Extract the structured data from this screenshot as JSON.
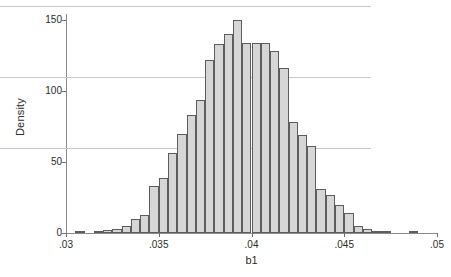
{
  "chart_data": {
    "type": "bar",
    "subtype": "histogram",
    "title": "",
    "xlabel": "b1",
    "ylabel": "Density",
    "xlim": [
      0.03,
      0.05
    ],
    "ylim": [
      0,
      150
    ],
    "xticks": [
      ".03",
      ".035",
      ".04",
      ".045",
      ".05"
    ],
    "xtick_values": [
      0.03,
      0.035,
      0.04,
      0.045,
      0.05
    ],
    "yticks": [
      "0",
      "50",
      "100",
      "150"
    ],
    "ytick_values": [
      0,
      50,
      100,
      150
    ],
    "grid": "horizontal",
    "legend": "none",
    "bar_fill_color": "#d6d6d6",
    "bar_edge_color": "#5d5d5d",
    "gridline_color": "#c9c9c9",
    "axis_color": "#8a8a8a",
    "bin_width": 0.0005,
    "bin_starts": [
      0.0305,
      0.031,
      0.0315,
      0.032,
      0.0325,
      0.033,
      0.0335,
      0.034,
      0.0345,
      0.035,
      0.0355,
      0.036,
      0.0365,
      0.037,
      0.0375,
      0.038,
      0.0385,
      0.039,
      0.0395,
      0.04,
      0.0405,
      0.041,
      0.0415,
      0.042,
      0.0425,
      0.043,
      0.0435,
      0.044,
      0.0445,
      0.045,
      0.0455,
      0.046,
      0.0465,
      0.047,
      0.0475,
      0.048,
      0.0485
    ],
    "values": [
      1,
      0,
      1,
      2,
      3,
      5,
      10,
      13,
      33,
      39,
      56,
      70,
      83,
      94,
      122,
      133,
      140,
      150,
      134,
      134,
      134,
      128,
      116,
      78,
      69,
      61,
      31,
      27,
      20,
      14,
      5,
      3,
      1,
      1,
      0,
      0,
      1
    ]
  }
}
